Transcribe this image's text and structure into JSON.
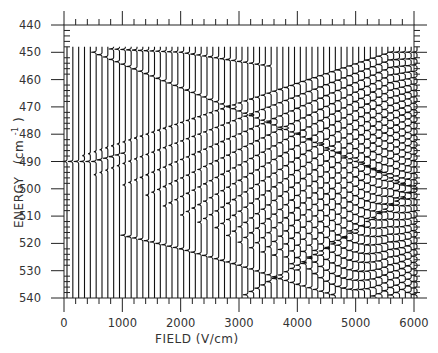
{
  "chart_data": {
    "type": "line",
    "title": "",
    "xlabel": "FIELD  (V/cm)",
    "ylabel": "ENERGY  (cm⁻¹)",
    "ylabel_text": "ENERGY",
    "ylabel_unit": "(cm",
    "ylabel_unit_exp": "-1",
    "ylabel_unit_close": ")",
    "xlim": [
      0,
      6000
    ],
    "ylim": [
      440,
      540
    ],
    "y_inverted": true,
    "x_ticks": [
      0,
      1000,
      2000,
      3000,
      4000,
      5000,
      6000
    ],
    "x_tick_labels": [
      "0",
      "1000",
      "2000",
      "3000",
      "4000",
      "5000",
      "6000"
    ],
    "x_minor_step": 200,
    "y_ticks": [
      440,
      450,
      460,
      470,
      480,
      490,
      500,
      510,
      520,
      530,
      540
    ],
    "y_tick_labels": [
      "440",
      "450",
      "460",
      "470",
      "480",
      "490",
      "500",
      "510",
      "520",
      "530",
      "540"
    ],
    "y_minor_step": 2,
    "grid": false,
    "legend": null,
    "series": [
      {
        "name": "upper Stark branch",
        "points": [
          [
            0,
            448
          ],
          [
            2000,
            450
          ],
          [
            3500,
            455
          ]
        ]
      },
      {
        "name": "descending branch (from 450)",
        "points": [
          [
            500,
            450
          ],
          [
            2000,
            463
          ],
          [
            4000,
            480
          ],
          [
            6000,
            500
          ]
        ]
      },
      {
        "name": "fan origin",
        "points": [
          [
            0,
            490
          ],
          [
            500,
            490
          ],
          [
            1000,
            487
          ]
        ]
      },
      {
        "name": "descending branch (from 518)",
        "points": [
          [
            1000,
            517
          ],
          [
            2000,
            522
          ],
          [
            3000,
            528
          ],
          [
            4000,
            535
          ],
          [
            4800,
            540
          ]
        ]
      },
      {
        "name": "ascending branch",
        "points": [
          [
            3000,
            540
          ],
          [
            4000,
            528
          ],
          [
            5000,
            515
          ],
          [
            6000,
            500
          ]
        ]
      }
    ],
    "traces": {
      "field_start": 0,
      "field_end": 6000,
      "field_step": 100,
      "energy_start": 448,
      "energy_end": 540
    }
  }
}
